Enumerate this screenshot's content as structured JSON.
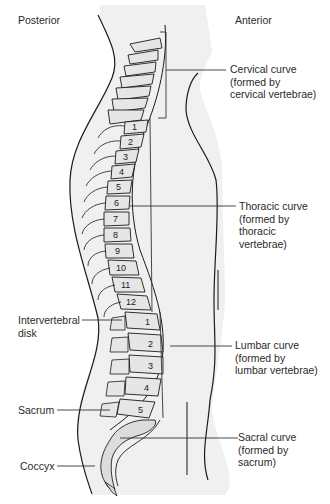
{
  "figure": {
    "orientation_labels": {
      "posterior": "Posterior",
      "anterior": "Anterior"
    },
    "left_labels": [
      {
        "id": "intervertebral-disk",
        "text": "Intervertebral\ndisk"
      },
      {
        "id": "sacrum",
        "text": "Sacrum"
      },
      {
        "id": "coccyx",
        "text": "Coccyx"
      }
    ],
    "right_labels": [
      {
        "id": "cervical-curve",
        "text": "Cervical curve\n(formed by\ncervical vertebrae)"
      },
      {
        "id": "thoracic-curve",
        "text": "Thoracic curve\n(formed by\nthoracic\nvertebrae)"
      },
      {
        "id": "lumbar-curve",
        "text": "Lumbar curve\n(formed by\nlumbar vertebrae)"
      },
      {
        "id": "sacral-curve",
        "text": "Sacral curve\n(formed by\nsacrum)"
      }
    ],
    "thoracic_numbers": [
      "1",
      "2",
      "3",
      "4",
      "5",
      "6",
      "7",
      "8",
      "9",
      "10",
      "11",
      "12"
    ],
    "lumbar_numbers": [
      "1",
      "2",
      "3",
      "4",
      "5"
    ],
    "colors": {
      "body_fill": "#efefef",
      "bone_fill": "#e6e6e6",
      "line": "#1a1a1a",
      "leader": "#333333"
    }
  }
}
